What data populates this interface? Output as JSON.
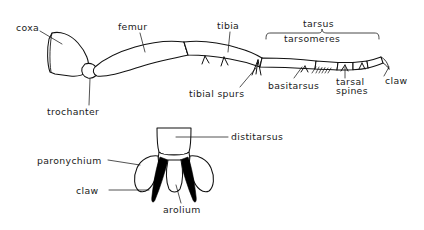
{
  "diagram": {
    "ink_color": "#111111",
    "background_color": "#ffffff",
    "fill_color": "#ffffff",
    "black_fill_color": "#000000"
  },
  "upper_figure": {
    "name": "whole-leg-lateral-view",
    "labels": {
      "coxa": "coxa",
      "trochanter": "trochanter",
      "femur": "femur",
      "tibia": "tibia",
      "tibial_spurs": "tibial spurs",
      "tarsus": "tarsus",
      "tarsomeres": "tarsomeres",
      "basitarsus": "basitarsus",
      "tarsal_spines_line1": "tarsal",
      "tarsal_spines_line2": "spines",
      "claw": "claw"
    }
  },
  "lower_figure": {
    "name": "pretarsus-detail-view",
    "labels": {
      "distitarsus": "distitarsus",
      "paronychium": "paronychium",
      "claw": "claw",
      "arolium": "arolium"
    }
  }
}
